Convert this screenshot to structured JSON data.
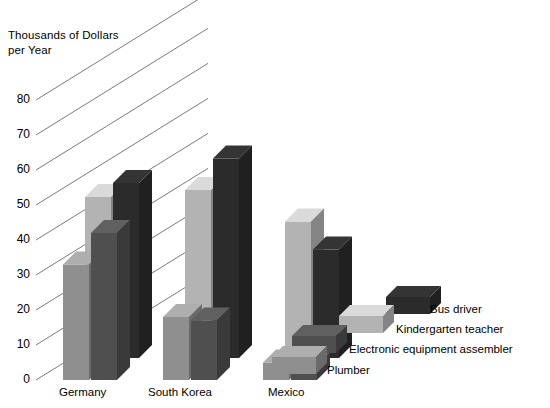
{
  "chart_data": {
    "type": "bar",
    "title": "",
    "ylabel": "Thousands of Dollars per Year",
    "ylabel_lines": [
      "Thousands of Dollars",
      "per Year"
    ],
    "xlabel": "",
    "categories": [
      "Germany",
      "South Korea",
      "Mexico"
    ],
    "ylim": [
      0,
      90
    ],
    "yticks": [
      0,
      10,
      20,
      30,
      40,
      50,
      60,
      70,
      80
    ],
    "ytick_labels": [
      "0",
      "10",
      "20",
      "30",
      "40",
      "50",
      "60",
      "70",
      "80"
    ],
    "grid": "perspective-diagonal",
    "legend_position": "bottom-right",
    "projection": "3d",
    "series": [
      {
        "name": "Plumber",
        "color": "#8f8f8f",
        "values": [
          33,
          18,
          5
        ]
      },
      {
        "name": "Electronic equipment assembler",
        "color": "#4f4f4f",
        "values": [
          42,
          17,
          4
        ]
      },
      {
        "name": "Kindergarten teacher",
        "color": "#b3b3b3",
        "values": [
          46,
          48,
          39
        ]
      },
      {
        "name": "Bus driver",
        "color": "#2b2b2b",
        "values": [
          50,
          57,
          31
        ]
      }
    ]
  },
  "colors": {
    "background": "#ffffff",
    "gridline": "#6b6b6b",
    "axis_text": "#000000",
    "plumber": "#8f8f8f",
    "electronic_equipment_assembler": "#4f4f4f",
    "kindergarten_teacher": "#b3b3b3",
    "bus_driver": "#2b2b2b"
  },
  "axis": {
    "title_line_1": "Thousands of Dollars",
    "title_line_2": "per Year",
    "ticks": [
      {
        "value": "80"
      },
      {
        "value": "70"
      },
      {
        "value": "60"
      },
      {
        "value": "50"
      },
      {
        "value": "40"
      },
      {
        "value": "30"
      },
      {
        "value": "20"
      },
      {
        "value": "10"
      },
      {
        "value": "0"
      }
    ]
  },
  "categories": [
    {
      "label": "Germany"
    },
    {
      "label": "South Korea"
    },
    {
      "label": "Mexico"
    }
  ],
  "legend": {
    "items": [
      {
        "label": "Bus driver",
        "color": "#2b2b2b"
      },
      {
        "label": "Kindergarten teacher",
        "color": "#b3b3b3"
      },
      {
        "label": "Electronic equipment assembler",
        "color": "#4f4f4f"
      },
      {
        "label": "Plumber",
        "color": "#8f8f8f"
      }
    ]
  }
}
